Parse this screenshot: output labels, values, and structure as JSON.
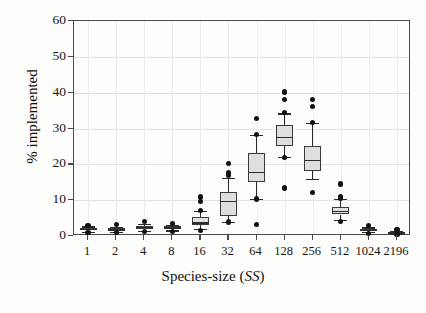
{
  "chart_data": {
    "type": "box",
    "title": "",
    "xlabel": "Species-size (SS)",
    "xlabel_plain": "Species-size (",
    "xlabel_italic": "SS",
    "xlabel_close": ")",
    "ylabel": "% implemented",
    "xlim_categories": [
      "1",
      "2",
      "4",
      "8",
      "16",
      "32",
      "64",
      "128",
      "256",
      "512",
      "1024",
      "2196"
    ],
    "ylim": [
      0,
      60
    ],
    "yticks": [
      0,
      10,
      20,
      30,
      40,
      50,
      60
    ],
    "ytick_labels": [
      "0",
      "10",
      "20",
      "30",
      "40",
      "50",
      "60"
    ],
    "grid": true,
    "legend": "none",
    "boxes": [
      {
        "category": "1",
        "whisker_low": 1.2,
        "q1": 1.6,
        "median": 2.0,
        "q3": 2.3,
        "whisker_high": 2.7,
        "outliers": [
          3.0,
          1.0
        ]
      },
      {
        "category": "2",
        "whisker_low": 1.1,
        "q1": 1.5,
        "median": 1.9,
        "q3": 2.2,
        "whisker_high": 2.6,
        "outliers": [
          3.2,
          0.9
        ]
      },
      {
        "category": "4",
        "whisker_low": 1.5,
        "q1": 2.0,
        "median": 2.5,
        "q3": 2.9,
        "whisker_high": 3.4,
        "outliers": [
          4.1,
          1.2
        ]
      },
      {
        "category": "8",
        "whisker_low": 1.6,
        "q1": 2.0,
        "median": 2.4,
        "q3": 2.8,
        "whisker_high": 3.2,
        "outliers": [
          3.6,
          1.3
        ]
      },
      {
        "category": "16",
        "whisker_low": 2.0,
        "q1": 3.0,
        "median": 3.8,
        "q3": 5.3,
        "whisker_high": 7.0,
        "outliers": [
          10.9,
          9.6,
          7.2,
          1.6
        ]
      },
      {
        "category": "32",
        "whisker_low": 4.0,
        "q1": 5.6,
        "median": 9.9,
        "q3": 12.3,
        "whisker_high": 16.3,
        "outliers": [
          20.2,
          17.6,
          16.9,
          3.9
        ]
      },
      {
        "category": "64",
        "whisker_low": 10.4,
        "q1": 15.1,
        "median": 18.0,
        "q3": 23.1,
        "whisker_high": 28.3,
        "outliers": [
          32.9,
          28.4,
          10.3,
          3.2
        ]
      },
      {
        "category": "128",
        "whisker_low": 22.0,
        "q1": 25.0,
        "median": 27.6,
        "q3": 30.9,
        "whisker_high": 34.2,
        "outliers": [
          40.2,
          38.0,
          34.4,
          21.8,
          13.4
        ]
      },
      {
        "category": "256",
        "whisker_low": 15.9,
        "q1": 18.2,
        "median": 21.2,
        "q3": 25.0,
        "whisker_high": 31.5,
        "outliers": [
          38.2,
          36.1,
          31.6,
          12.1
        ]
      },
      {
        "category": "512",
        "whisker_low": 4.6,
        "q1": 6.0,
        "median": 7.0,
        "q3": 8.2,
        "whisker_high": 10.4,
        "outliers": [
          14.5,
          11.1,
          10.6,
          4.0
        ]
      },
      {
        "category": "1024",
        "whisker_low": 1.1,
        "q1": 1.4,
        "median": 1.7,
        "q3": 2.0,
        "whisker_high": 2.4,
        "outliers": [
          3.0,
          0.8
        ]
      },
      {
        "category": "2196",
        "whisker_low": 0.6,
        "q1": 0.8,
        "median": 1.0,
        "q3": 1.2,
        "whisker_high": 1.5,
        "outliers": [
          1.9,
          0.4
        ]
      }
    ]
  }
}
